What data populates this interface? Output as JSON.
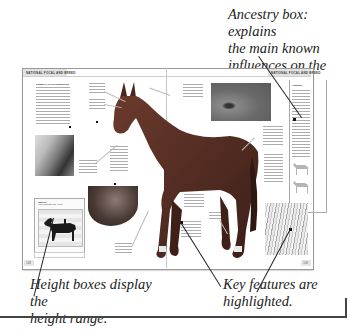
{
  "annotations": {
    "ancestry": {
      "line1": "Ancestry box: explains",
      "line2": "the main known",
      "line3": "influences on the breed."
    },
    "height": {
      "line1": "Height boxes display the",
      "line2": "height range."
    },
    "key_features": {
      "line1": "Key features are",
      "line2": "highlighted."
    }
  },
  "spread": {
    "left_header": "NATIONAL FOCAL AND BREED",
    "right_header": "NATIONAL FOCAL AND BREED",
    "left_page_number": "148",
    "right_page_number": "149",
    "intro_heading": "GENERAL CHARACTERISTICS",
    "ancestry_heading": "ANCESTRY",
    "height_heading": "HEIGHT",
    "height_subtitle": "Horse Measurement 15hh - 16.2 hh",
    "feature_labels": [
      "EARS",
      "HEAD",
      "MUZZLE AND NOSTRILS",
      "LEGS",
      "EYES",
      "BACK",
      "SHOULDERS",
      "HOOVES",
      "COLOR",
      "MANE AND TAIL",
      "BODY"
    ]
  },
  "colors": {
    "page_border": "#9a9a9a",
    "header_bar": "#e2e2e2",
    "horse": "#5a3026",
    "annotation_text": "#222222",
    "pointer_line": "#222222"
  }
}
